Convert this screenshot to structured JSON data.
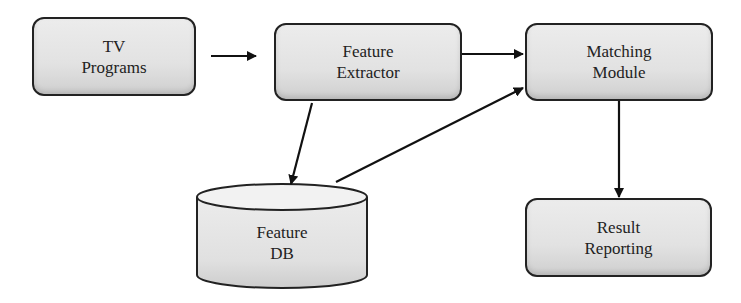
{
  "diagram": {
    "type": "flowchart",
    "nodes": [
      {
        "id": "tv_programs",
        "label": "TV\nPrograms",
        "shape": "rounded-rect"
      },
      {
        "id": "feature_extractor",
        "label": "Feature\nExtractor",
        "shape": "rounded-rect"
      },
      {
        "id": "matching_module",
        "label": "Matching\nModule",
        "shape": "rounded-rect"
      },
      {
        "id": "feature_db",
        "label": "Feature\nDB",
        "shape": "cylinder"
      },
      {
        "id": "result_reporting",
        "label": "Result\nReporting",
        "shape": "rounded-rect"
      }
    ],
    "edges": [
      {
        "from": "tv_programs",
        "to": "feature_extractor"
      },
      {
        "from": "feature_extractor",
        "to": "matching_module"
      },
      {
        "from": "feature_extractor",
        "to": "feature_db"
      },
      {
        "from": "feature_db",
        "to": "matching_module"
      },
      {
        "from": "matching_module",
        "to": "result_reporting"
      }
    ]
  },
  "colors": {
    "stroke": "#222222",
    "fill": "#e2e2e2"
  }
}
